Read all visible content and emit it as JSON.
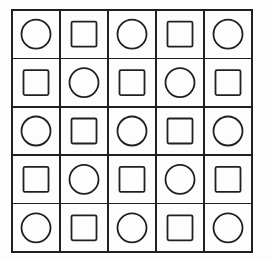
{
  "figure": {
    "name": "alternating-shape-grid",
    "rows": 5,
    "columns": 5,
    "background_color": "#fdfdfd",
    "line_color": "#231f20",
    "shape_color": "#231f20",
    "fill_color": "none",
    "outer_border_width": 2.2,
    "inner_grid_line_width": 1.6,
    "shape_stroke_width": 1.8,
    "geometry": {
      "grid_left": 12,
      "grid_top": 10,
      "grid_right": 252,
      "grid_bottom": 252,
      "cell_width": 48,
      "cell_height": 48.4,
      "circle_radius": 14.5,
      "square_side": 25,
      "square_corner_radius": 1.5
    },
    "rule": "circle when (row + column) is even, square when odd",
    "cells": [
      [
        {
          "shape": "circle",
          "row": 0,
          "col": 0
        },
        {
          "shape": "square",
          "row": 0,
          "col": 1
        },
        {
          "shape": "circle",
          "row": 0,
          "col": 2
        },
        {
          "shape": "square",
          "row": 0,
          "col": 3
        },
        {
          "shape": "circle",
          "row": 0,
          "col": 4
        }
      ],
      [
        {
          "shape": "square",
          "row": 1,
          "col": 0
        },
        {
          "shape": "circle",
          "row": 1,
          "col": 1
        },
        {
          "shape": "square",
          "row": 1,
          "col": 2
        },
        {
          "shape": "circle",
          "row": 1,
          "col": 3
        },
        {
          "shape": "square",
          "row": 1,
          "col": 4
        }
      ],
      [
        {
          "shape": "circle",
          "row": 2,
          "col": 0
        },
        {
          "shape": "square",
          "row": 2,
          "col": 1
        },
        {
          "shape": "circle",
          "row": 2,
          "col": 2
        },
        {
          "shape": "square",
          "row": 2,
          "col": 3
        },
        {
          "shape": "circle",
          "row": 2,
          "col": 4
        }
      ],
      [
        {
          "shape": "square",
          "row": 3,
          "col": 0
        },
        {
          "shape": "circle",
          "row": 3,
          "col": 1
        },
        {
          "shape": "square",
          "row": 3,
          "col": 2
        },
        {
          "shape": "circle",
          "row": 3,
          "col": 3
        },
        {
          "shape": "square",
          "row": 3,
          "col": 4
        }
      ],
      [
        {
          "shape": "circle",
          "row": 4,
          "col": 0
        },
        {
          "shape": "square",
          "row": 4,
          "col": 1
        },
        {
          "shape": "circle",
          "row": 4,
          "col": 2
        },
        {
          "shape": "square",
          "row": 4,
          "col": 3
        },
        {
          "shape": "circle",
          "row": 4,
          "col": 4
        }
      ]
    ],
    "counts": {
      "circles": 13,
      "squares": 12,
      "total_cells": 25
    }
  }
}
